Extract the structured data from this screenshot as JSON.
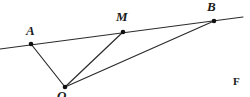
{
  "figure": {
    "type": "geometry-diagram",
    "canvas": {
      "width": 250,
      "height": 97
    },
    "background_color": "#ffffff",
    "stroke_color": "#2b2b2b",
    "stroke_width": 1.2,
    "point_color": "#111111",
    "point_radius": 2.3
  },
  "points": [
    {
      "id": "A",
      "label": "A",
      "x": 31,
      "y": 44,
      "label_x": 26,
      "label_y": 24,
      "dot": true
    },
    {
      "id": "M",
      "label": "M",
      "x": 123,
      "y": 32,
      "label_x": 116,
      "label_y": 10,
      "dot": true
    },
    {
      "id": "B",
      "label": "B",
      "x": 214,
      "y": 21,
      "label_x": 207,
      "label_y": 0,
      "dot": true
    },
    {
      "id": "O",
      "label": "O",
      "x": 65,
      "y": 87,
      "label_x": 57,
      "label_y": 89,
      "dot": true
    }
  ],
  "extra_labels": [
    {
      "id": "F",
      "label": "F",
      "x": 233,
      "y": 76
    }
  ],
  "segments": [
    {
      "id": "transversal",
      "name": "line-through-A-M-B",
      "x1": 0,
      "y1": 49,
      "x2": 243,
      "y2": 17
    },
    {
      "id": "OA",
      "name": "segment-O-A",
      "x1": 65,
      "y1": 87,
      "x2": 31,
      "y2": 44
    },
    {
      "id": "OM",
      "name": "segment-O-M",
      "x1": 65,
      "y1": 87,
      "x2": 123,
      "y2": 32
    },
    {
      "id": "OB",
      "name": "segment-O-B",
      "x1": 65,
      "y1": 87,
      "x2": 214,
      "y2": 21
    }
  ]
}
